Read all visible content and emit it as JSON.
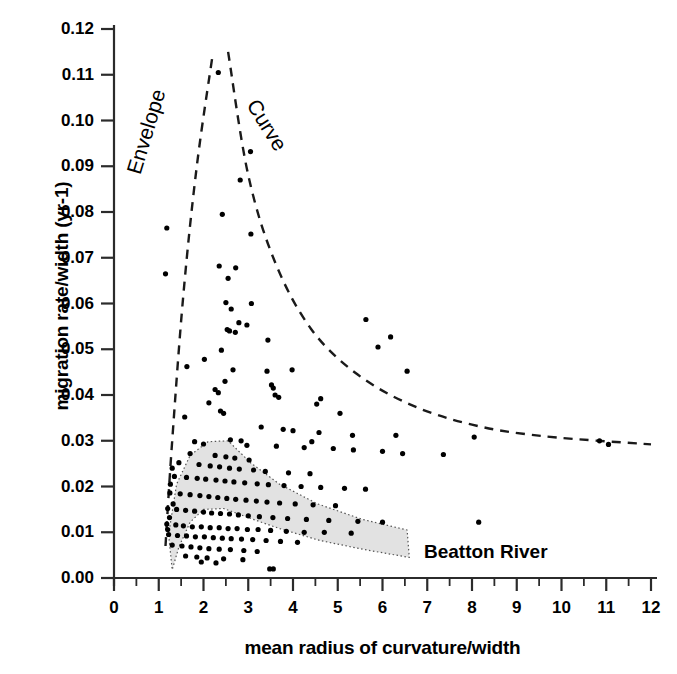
{
  "chart_data": {
    "type": "scatter",
    "title": "",
    "xlabel": "mean radius of curvature/width",
    "ylabel": "migration rate/width (yr-1)",
    "xlim": [
      0,
      12
    ],
    "ylim": [
      0.0,
      0.12
    ],
    "x_major_ticks": [
      0,
      1,
      2,
      3,
      4,
      5,
      6,
      7,
      8,
      9,
      10,
      11,
      12
    ],
    "x_tick_labels": [
      "0",
      "1",
      "2",
      "3",
      "4",
      "5",
      "6",
      "7",
      "8",
      "9",
      "10",
      "11",
      "12"
    ],
    "x_minor_step": 0.5,
    "y_major_ticks": [
      0.0,
      0.01,
      0.02,
      0.03,
      0.04,
      0.05,
      0.06,
      0.07,
      0.08,
      0.09,
      0.1,
      0.11,
      0.12
    ],
    "y_tick_labels": [
      "0.00",
      "0.01",
      "0.02",
      "0.03",
      "0.04",
      "0.05",
      "0.06",
      "0.07",
      "0.08",
      "0.09",
      "0.10",
      "0.11",
      "0.12"
    ],
    "grid": false,
    "legend": false,
    "marker_color": "#000000",
    "marker_size_px": 4.6,
    "series": [
      {
        "name": "migration data",
        "points": [
          [
            2.33,
            0.1105
          ],
          [
            3.05,
            0.0932
          ],
          [
            2.82,
            0.087
          ],
          [
            2.42,
            0.0795
          ],
          [
            3.06,
            0.0752
          ],
          [
            1.18,
            0.0765
          ],
          [
            2.35,
            0.0682
          ],
          [
            2.72,
            0.0678
          ],
          [
            1.15,
            0.0665
          ],
          [
            2.55,
            0.0655
          ],
          [
            2.5,
            0.0602
          ],
          [
            3.07,
            0.06
          ],
          [
            2.62,
            0.0588
          ],
          [
            2.79,
            0.0558
          ],
          [
            2.97,
            0.0553
          ],
          [
            2.53,
            0.0543
          ],
          [
            2.58,
            0.054
          ],
          [
            2.71,
            0.0537
          ],
          [
            6.18,
            0.0527
          ],
          [
            5.63,
            0.0565
          ],
          [
            3.44,
            0.052
          ],
          [
            5.9,
            0.0505
          ],
          [
            2.4,
            0.0498
          ],
          [
            2.02,
            0.0478
          ],
          [
            1.63,
            0.0462
          ],
          [
            2.66,
            0.0455
          ],
          [
            3.42,
            0.0452
          ],
          [
            2.48,
            0.043
          ],
          [
            3.52,
            0.0422
          ],
          [
            3.56,
            0.0415
          ],
          [
            2.26,
            0.0412
          ],
          [
            2.33,
            0.0405
          ],
          [
            3.6,
            0.04
          ],
          [
            3.68,
            0.0395
          ],
          [
            2.12,
            0.0383
          ],
          [
            4.53,
            0.038
          ],
          [
            2.38,
            0.0365
          ],
          [
            2.45,
            0.036
          ],
          [
            1.58,
            0.0352
          ],
          [
            3.29,
            0.033
          ],
          [
            3.78,
            0.0325
          ],
          [
            4.0,
            0.0322
          ],
          [
            4.58,
            0.0318
          ],
          [
            5.33,
            0.0312
          ],
          [
            6.3,
            0.0312
          ],
          [
            8.05,
            0.0308
          ],
          [
            10.85,
            0.03
          ],
          [
            11.05,
            0.0292
          ],
          [
            2.6,
            0.0302
          ],
          [
            2.84,
            0.03
          ],
          [
            1.8,
            0.0298
          ],
          [
            2.0,
            0.0293
          ],
          [
            2.97,
            0.029
          ],
          [
            3.63,
            0.0288
          ],
          [
            4.25,
            0.0285
          ],
          [
            4.9,
            0.0283
          ],
          [
            5.35,
            0.028
          ],
          [
            6.0,
            0.0277
          ],
          [
            6.45,
            0.0272
          ],
          [
            7.36,
            0.027
          ],
          [
            1.7,
            0.0272
          ],
          [
            2.26,
            0.0268
          ],
          [
            2.5,
            0.0265
          ],
          [
            2.7,
            0.0262
          ],
          [
            3.02,
            0.0258
          ],
          [
            1.45,
            0.0252
          ],
          [
            1.9,
            0.0248
          ],
          [
            2.15,
            0.0245
          ],
          [
            2.36,
            0.0243
          ],
          [
            2.58,
            0.024
          ],
          [
            2.8,
            0.0238
          ],
          [
            3.12,
            0.0236
          ],
          [
            3.38,
            0.0233
          ],
          [
            3.9,
            0.023
          ],
          [
            4.38,
            0.0228
          ],
          [
            1.35,
            0.0222
          ],
          [
            1.62,
            0.022
          ],
          [
            1.86,
            0.0218
          ],
          [
            2.05,
            0.0216
          ],
          [
            2.28,
            0.0214
          ],
          [
            2.48,
            0.0212
          ],
          [
            2.68,
            0.021
          ],
          [
            2.92,
            0.0208
          ],
          [
            3.2,
            0.0206
          ],
          [
            3.45,
            0.0204
          ],
          [
            3.8,
            0.0202
          ],
          [
            4.18,
            0.02
          ],
          [
            4.62,
            0.0198
          ],
          [
            5.15,
            0.0196
          ],
          [
            5.62,
            0.0194
          ],
          [
            1.25,
            0.0186
          ],
          [
            1.48,
            0.0184
          ],
          [
            1.7,
            0.0182
          ],
          [
            1.92,
            0.018
          ],
          [
            2.12,
            0.0178
          ],
          [
            2.32,
            0.0176
          ],
          [
            2.52,
            0.0174
          ],
          [
            2.72,
            0.0172
          ],
          [
            2.95,
            0.017
          ],
          [
            3.18,
            0.0168
          ],
          [
            3.42,
            0.0166
          ],
          [
            3.7,
            0.0164
          ],
          [
            4.05,
            0.0162
          ],
          [
            4.45,
            0.016
          ],
          [
            4.95,
            0.0158
          ],
          [
            1.2,
            0.0152
          ],
          [
            1.4,
            0.015
          ],
          [
            1.6,
            0.0148
          ],
          [
            1.8,
            0.0146
          ],
          [
            2.0,
            0.0144
          ],
          [
            2.18,
            0.0142
          ],
          [
            2.38,
            0.0141
          ],
          [
            2.58,
            0.014
          ],
          [
            2.78,
            0.0138
          ],
          [
            3.0,
            0.0136
          ],
          [
            3.25,
            0.0134
          ],
          [
            3.55,
            0.0132
          ],
          [
            3.88,
            0.013
          ],
          [
            4.3,
            0.0128
          ],
          [
            4.8,
            0.0126
          ],
          [
            5.45,
            0.0124
          ],
          [
            6.0,
            0.0122
          ],
          [
            8.15,
            0.0122
          ],
          [
            1.18,
            0.0118
          ],
          [
            1.38,
            0.0116
          ],
          [
            1.55,
            0.0114
          ],
          [
            1.75,
            0.0112
          ],
          [
            1.95,
            0.0112
          ],
          [
            2.15,
            0.011
          ],
          [
            2.35,
            0.011
          ],
          [
            2.55,
            0.0108
          ],
          [
            2.75,
            0.0108
          ],
          [
            2.98,
            0.0106
          ],
          [
            3.22,
            0.0106
          ],
          [
            3.5,
            0.0104
          ],
          [
            3.85,
            0.0102
          ],
          [
            4.25,
            0.01
          ],
          [
            4.7,
            0.01
          ],
          [
            5.3,
            0.0098
          ],
          [
            1.22,
            0.0095
          ],
          [
            1.42,
            0.0093
          ],
          [
            1.62,
            0.0092
          ],
          [
            1.82,
            0.009
          ],
          [
            2.02,
            0.009
          ],
          [
            2.22,
            0.0088
          ],
          [
            2.42,
            0.0087
          ],
          [
            2.62,
            0.0086
          ],
          [
            2.85,
            0.0085
          ],
          [
            3.1,
            0.0084
          ],
          [
            3.4,
            0.0082
          ],
          [
            3.72,
            0.008
          ],
          [
            4.1,
            0.0078
          ],
          [
            1.3,
            0.0072
          ],
          [
            1.52,
            0.007
          ],
          [
            1.72,
            0.0068
          ],
          [
            1.92,
            0.0066
          ],
          [
            2.12,
            0.0064
          ],
          [
            2.35,
            0.0063
          ],
          [
            2.6,
            0.0062
          ],
          [
            2.9,
            0.006
          ],
          [
            3.2,
            0.0058
          ],
          [
            1.6,
            0.0048
          ],
          [
            1.85,
            0.0046
          ],
          [
            2.08,
            0.0044
          ],
          [
            2.45,
            0.0042
          ],
          [
            2.88,
            0.004
          ],
          [
            1.95,
            0.0035
          ],
          [
            2.28,
            0.0033
          ],
          [
            3.48,
            0.002
          ],
          [
            3.56,
            0.002
          ],
          [
            1.26,
            0.0205
          ],
          [
            1.3,
            0.024
          ],
          [
            1.32,
            0.0162
          ],
          [
            1.24,
            0.0132
          ],
          [
            1.2,
            0.0106
          ],
          [
            6.55,
            0.0452
          ],
          [
            5.05,
            0.036
          ],
          [
            4.62,
            0.0392
          ],
          [
            3.98,
            0.0455
          ],
          [
            4.42,
            0.0298
          ]
        ]
      }
    ],
    "annotations": [
      {
        "name": "envelope-label",
        "text": "Envelope",
        "rotation_deg": -73
      },
      {
        "name": "curve-label",
        "text": "Curve",
        "rotation_deg": 58
      },
      {
        "name": "beatton-label",
        "text": "Beatton River",
        "rotation_deg": 0
      }
    ],
    "envelope_curve": {
      "style": "dashed",
      "color": "#1a1a1a",
      "left_branch": [
        [
          1.15,
          0.007
        ],
        [
          1.3,
          0.03
        ],
        [
          1.55,
          0.062
        ],
        [
          1.85,
          0.09
        ],
        [
          2.2,
          0.114
        ]
      ],
      "right_branch": [
        [
          2.55,
          0.115
        ],
        [
          3.0,
          0.088
        ],
        [
          3.6,
          0.069
        ],
        [
          4.4,
          0.0545
        ],
        [
          5.4,
          0.0448
        ],
        [
          6.6,
          0.038
        ],
        [
          8.0,
          0.0335
        ],
        [
          9.6,
          0.031
        ],
        [
          12.0,
          0.0292
        ]
      ]
    },
    "beatton_region": {
      "label": "Beatton River",
      "fill": "#e2e2e2",
      "outline": "dotted",
      "polygon": [
        [
          1.22,
          0.0095
        ],
        [
          1.4,
          0.0205
        ],
        [
          1.7,
          0.0268
        ],
        [
          2.1,
          0.0298
        ],
        [
          2.55,
          0.03
        ],
        [
          3.05,
          0.0252
        ],
        [
          3.7,
          0.0205
        ],
        [
          4.55,
          0.0162
        ],
        [
          5.55,
          0.0128
        ],
        [
          6.55,
          0.0105
        ],
        [
          6.6,
          0.0045
        ],
        [
          5.6,
          0.0062
        ],
        [
          4.6,
          0.0082
        ],
        [
          3.7,
          0.0108
        ],
        [
          3.0,
          0.0132
        ],
        [
          2.45,
          0.0152
        ],
        [
          2.0,
          0.015
        ],
        [
          1.7,
          0.0122
        ],
        [
          1.45,
          0.0068
        ],
        [
          1.3,
          0.0018
        ]
      ]
    }
  }
}
